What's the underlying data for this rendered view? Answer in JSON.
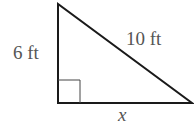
{
  "figure": {
    "type": "right-triangle",
    "labels": {
      "vertical_leg": "6 ft",
      "hypotenuse": "10 ft",
      "horizontal_leg": "x"
    },
    "colors": {
      "stroke": "#1a1a1a",
      "label": "#555555",
      "right_angle_marker": "#444444"
    }
  }
}
